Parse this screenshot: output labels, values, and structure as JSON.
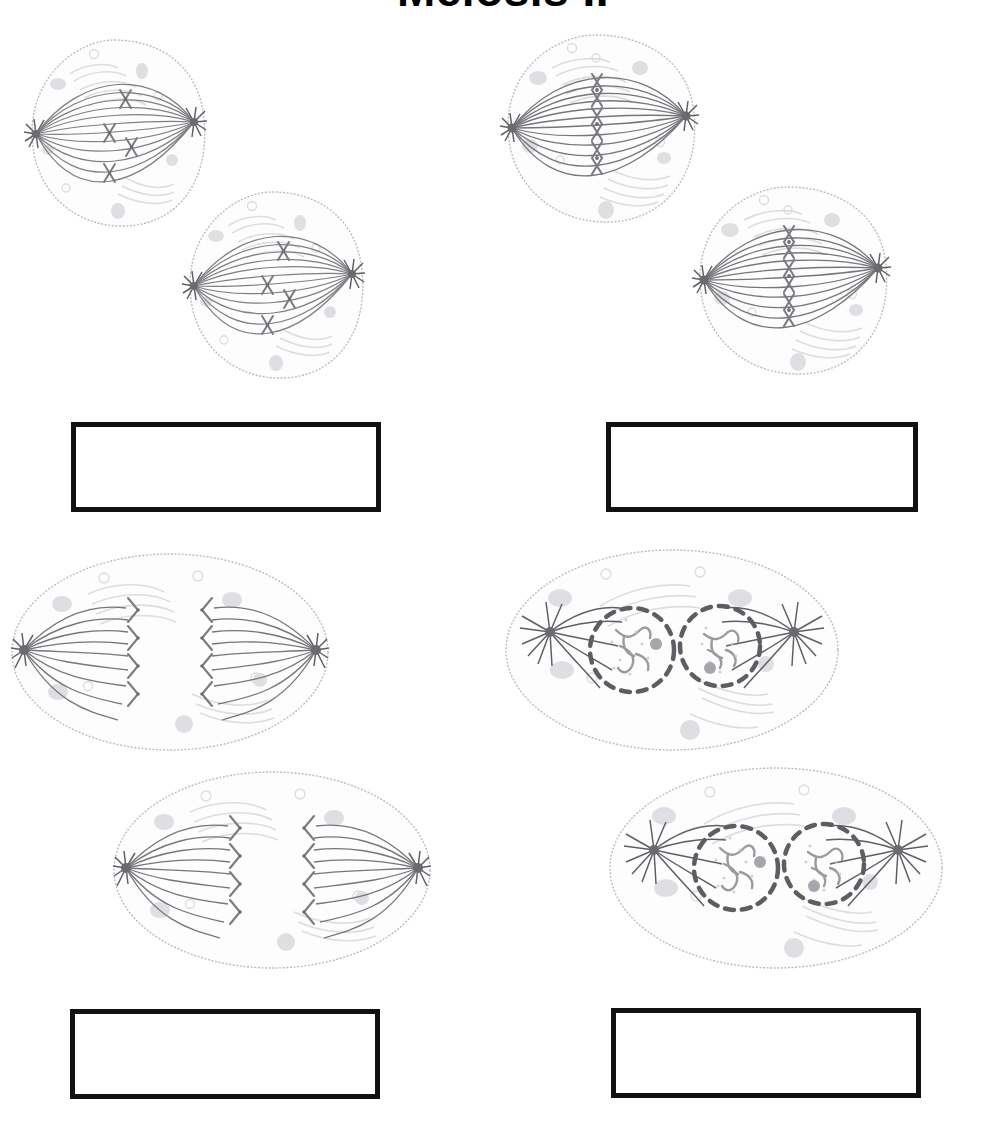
{
  "title": "Meiosis II",
  "page": {
    "width": 1006,
    "height": 1134,
    "background": "#ffffff"
  },
  "colors": {
    "membrane": "#b9b9bd",
    "spindle": "#6d6d72",
    "chromosome": "#7c7c82",
    "organelle": "#d9d9dd",
    "organelle_dark": "#c2c2c6",
    "nuclear_envelope": "#6b6b71",
    "chromatin": "#9a9aa0",
    "box_border": "#111111",
    "title": "#000000"
  },
  "panels": [
    {
      "id": "prometaphase-ii",
      "stage_label": "",
      "position": "top-left",
      "cell_count": 2,
      "description": "Two round cells with full spindles; X-shaped chromosomes scattered within the spindle, not yet aligned",
      "chromosomes_per_cell": 4,
      "chromosome_shape": "X",
      "chromosome_arrangement": "scattered",
      "nuclear_envelope": "absent",
      "cell_shape": "round",
      "answer_box": {
        "value": "",
        "placeholder": ""
      }
    },
    {
      "id": "metaphase-ii",
      "stage_label": "",
      "position": "top-right",
      "cell_count": 2,
      "description": "Two round cells with full spindles; X-shaped chromosomes aligned single-file along the metaphase plate at the cell equator",
      "chromosomes_per_cell": 4,
      "chromosome_shape": "X",
      "chromosome_arrangement": "aligned-at-equator",
      "nuclear_envelope": "absent",
      "cell_shape": "round",
      "answer_box": {
        "value": "",
        "placeholder": ""
      }
    },
    {
      "id": "anaphase-ii",
      "stage_label": "",
      "position": "bottom-left",
      "cell_count": 2,
      "description": "Two elongated oval cells; sister chromatids separated into bent V shapes moving toward opposite poles, leaving an empty gap at the equator",
      "chromosomes_per_cell": 8,
      "chromosome_shape": "V",
      "chromosome_arrangement": "separating-to-poles",
      "nuclear_envelope": "absent",
      "cell_shape": "elongated-oval",
      "answer_box": {
        "value": "",
        "placeholder": ""
      }
    },
    {
      "id": "telophase-ii",
      "stage_label": "",
      "position": "bottom-right",
      "cell_count": 2,
      "description": "Two elongated oval cells; two reforming nuclei per cell shown as dashed nuclear envelopes enclosing decondensing chromatin and a nucleolus, asters at each pole",
      "nuclei_per_cell": 2,
      "chromosome_shape": "decondensed chromatin",
      "chromosome_arrangement": "enclosed-in-nuclei",
      "nuclear_envelope": "reforming-dashed",
      "cell_shape": "elongated-oval",
      "answer_box": {
        "value": "",
        "placeholder": ""
      }
    }
  ],
  "answer_boxes": [
    {
      "id": "answer-box-1",
      "for_panel": "prometaphase-ii",
      "value": "",
      "x": 71,
      "y": 422,
      "width": 310,
      "height": 90
    },
    {
      "id": "answer-box-2",
      "for_panel": "metaphase-ii",
      "value": "",
      "x": 606,
      "y": 422,
      "width": 312,
      "height": 90
    },
    {
      "id": "answer-box-3",
      "for_panel": "anaphase-ii",
      "value": "",
      "x": 70,
      "y": 1009,
      "width": 310,
      "height": 90
    },
    {
      "id": "answer-box-4",
      "for_panel": "telophase-ii",
      "value": "",
      "x": 611,
      "y": 1008,
      "width": 310,
      "height": 90
    }
  ]
}
